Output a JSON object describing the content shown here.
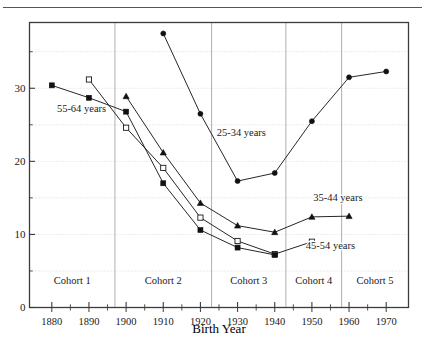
{
  "chart_data": {
    "type": "line",
    "title": "",
    "xlabel": "Birth Year",
    "ylabel": "",
    "x": [
      1880,
      1890,
      1900,
      1910,
      1920,
      1930,
      1940,
      1950,
      1960,
      1970
    ],
    "xticklabels": [
      "1880",
      "1890",
      "1900",
      "1910",
      "1920",
      "1930",
      "1940",
      "1950",
      "1960",
      "1970"
    ],
    "yticklabels": [
      "0",
      "10",
      "20",
      "30"
    ],
    "yticks": [
      0,
      10,
      20,
      30
    ],
    "yminorticks": [
      5,
      15,
      25,
      35
    ],
    "ylim": [
      0,
      39
    ],
    "xlim": [
      1874,
      1976
    ],
    "grid": "horizontal-dotted",
    "legend_position": "inline-annotations",
    "series": [
      {
        "name": "25-34 years",
        "marker": "filled-circle",
        "x": [
          1910,
          1920,
          1930,
          1940,
          1950,
          1960,
          1970
        ],
        "values": [
          37.5,
          26.5,
          17.3,
          18.4,
          25.5,
          31.5,
          32.3
        ]
      },
      {
        "name": "35-44 years",
        "marker": "filled-triangle",
        "x": [
          1900,
          1910,
          1920,
          1930,
          1940,
          1950,
          1960
        ],
        "values": [
          28.9,
          21.2,
          14.3,
          11.2,
          10.3,
          12.4,
          12.5
        ]
      },
      {
        "name": "45-54 years",
        "marker": "open-square",
        "x": [
          1890,
          1900,
          1910,
          1920,
          1930,
          1940,
          1950
        ],
        "values": [
          31.2,
          24.6,
          19.1,
          12.3,
          9.1,
          7.3,
          9.0
        ]
      },
      {
        "name": "55-64 years",
        "marker": "filled-square",
        "x": [
          1880,
          1890,
          1900,
          1910,
          1920,
          1930,
          1940
        ],
        "values": [
          30.4,
          28.7,
          26.8,
          17.0,
          10.6,
          8.2,
          7.2
        ]
      }
    ],
    "annotations": [
      {
        "text": "55-64 years",
        "x": 1888,
        "y": 26.8
      },
      {
        "text": "25-34 years",
        "x": 1931,
        "y": 23.5
      },
      {
        "text": "35-44 years",
        "x": 1957,
        "y": 14.6
      },
      {
        "text": "45-54 years",
        "x": 1955,
        "y": 8.0
      }
    ],
    "cohort_bands": [
      {
        "label": "Cohort 1",
        "start": 1874,
        "end": 1897
      },
      {
        "label": "Cohort 2",
        "start": 1897,
        "end": 1923
      },
      {
        "label": "Cohort 3",
        "start": 1923,
        "end": 1943
      },
      {
        "label": "Cohort 4",
        "start": 1943,
        "end": 1958
      },
      {
        "label": "Cohort 5",
        "start": 1958,
        "end": 1976
      }
    ],
    "cohort_label_y": 3.2,
    "colors": {
      "line": "#1a1a1a",
      "marker_fill": "#111111",
      "marker_open_fill": "#ffffff",
      "axis": "#3c3c3c",
      "grid": "#c8c8c8",
      "cohort_divider": "#9a9a9a",
      "background": "#ffffff"
    }
  }
}
